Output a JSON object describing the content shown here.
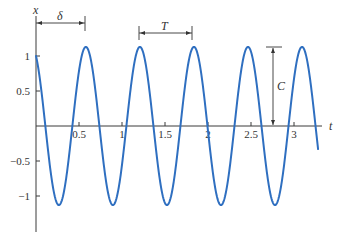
{
  "chart_data": {
    "type": "line",
    "title": "",
    "xlabel": "t",
    "ylabel": "x",
    "xlim": [
      0,
      3.3
    ],
    "ylim": [
      -1.35,
      1.45
    ],
    "grid": false,
    "legend": null,
    "x_ticks": [
      0.5,
      1,
      1.5,
      2,
      2.5,
      3
    ],
    "x_tick_labels": [
      "0.5",
      "1",
      "1.5",
      "2",
      "2.5",
      "3"
    ],
    "y_ticks": [
      1,
      0.5,
      -0.5,
      -1
    ],
    "y_tick_labels": [
      "1",
      "0.5",
      "−0.5",
      "−1"
    ],
    "series": [
      {
        "name": "x(t) = C cos(ωt − φ)",
        "color": "#2f6fc0",
        "function": {
          "C": 1.13,
          "omega": 10,
          "phase": 5.8
        },
        "t_range": [
          0,
          3.28
        ]
      }
    ],
    "annotations": [
      {
        "label": "δ",
        "kind": "horizontal-dimension",
        "from_t": 0,
        "to_t": 0.58,
        "description": "time delay to first peak"
      },
      {
        "label": "T",
        "kind": "horizontal-dimension",
        "from_t": 1.21,
        "to_t": 1.83,
        "description": "period between peaks"
      },
      {
        "label": "C",
        "kind": "vertical-dimension",
        "at_t": 2.78,
        "from_x": 0,
        "to_x": 1.13,
        "description": "amplitude"
      }
    ]
  }
}
